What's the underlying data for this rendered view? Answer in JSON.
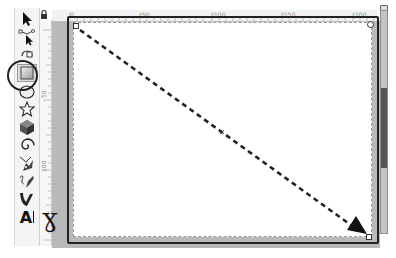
{
  "rulers": {
    "top_labels": [
      {
        "text": "0",
        "x": 70
      },
      {
        "text": "|50",
        "x": 140
      },
      {
        "text": "|100",
        "x": 212
      },
      {
        "text": "|150",
        "x": 282
      },
      {
        "text": "|200",
        "x": 353
      }
    ],
    "left_labels": [
      {
        "text": "50",
        "y": 100
      },
      {
        "text": "100",
        "y": 170
      }
    ]
  },
  "toolbox": {
    "tools": [
      {
        "name": "selector",
        "icon": "arrow-pointer-icon"
      },
      {
        "name": "node-editor",
        "icon": "node-arrow-icon"
      },
      {
        "name": "zoom",
        "icon": "zoom-icon"
      },
      {
        "name": "rectangle",
        "icon": "rectangle-icon",
        "selected": true
      },
      {
        "name": "ellipse",
        "icon": "ellipse-icon"
      },
      {
        "name": "star",
        "icon": "star-icon"
      },
      {
        "name": "3d-box",
        "icon": "cube-icon"
      },
      {
        "name": "spiral",
        "icon": "spiral-icon"
      },
      {
        "name": "pen",
        "icon": "pen-icon"
      },
      {
        "name": "pencil",
        "icon": "pencil-icon"
      },
      {
        "name": "calligraphy",
        "icon": "calligraphy-icon"
      },
      {
        "name": "text",
        "icon": "text-icon",
        "label": "A"
      }
    ]
  },
  "lock_glyph": "🔒",
  "annotation": {
    "arrow_color": "#222222",
    "callout_target": "rectangle tool",
    "hook_glyph": "ɣ"
  },
  "colors": {
    "canvas_bg": "#b9b9b9",
    "page": "#ffffff",
    "border": "#222222"
  }
}
